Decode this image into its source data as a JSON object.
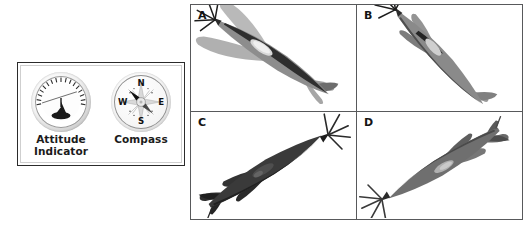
{
  "figure": {
    "type": "multi-panel-figure",
    "panel_count": 4
  },
  "instruments": {
    "box_border_color": "#2b2b2b",
    "items": [
      {
        "id": "attitude-indicator",
        "label_line1": "Attitude",
        "label_line2": "Indicator",
        "icon": "attitude-indicator-icon",
        "horizon_bank_degrees": -18,
        "reading": "banked, nose up"
      },
      {
        "id": "compass",
        "label_line1": "Compass",
        "label_line2": "",
        "icon": "compass-icon",
        "cardinals": [
          "N",
          "E",
          "S",
          "W"
        ],
        "needle_heading": "NW"
      }
    ]
  },
  "grid": {
    "border_color": "#58595b",
    "background": "#ffffff",
    "rows": 2,
    "columns": 2,
    "panels": [
      {
        "label": "A",
        "subject": "spitfire-aircraft",
        "view": "top rear three-quarter, nose down-right, elliptical wings fully visible",
        "fuselage_color": "#8d8d8d",
        "shadow_color": "#b4b4b4"
      },
      {
        "label": "B",
        "subject": "spitfire-aircraft",
        "view": "near edge-on, steep dive toward lower-right",
        "fuselage_color": "#8a8a8a",
        "shadow_color": "#5a5a5a"
      },
      {
        "label": "C",
        "subject": "spitfire-aircraft",
        "view": "underside silhouette, nose up-right, propeller visible",
        "fuselage_color": "#3a3a3a",
        "shadow_color": "#242424"
      },
      {
        "label": "D",
        "subject": "spitfire-aircraft",
        "view": "climbing toward upper-left, spinner and propeller at upper-left",
        "fuselage_color": "#6f6f6f",
        "shadow_color": "#4a4a4a"
      }
    ]
  }
}
